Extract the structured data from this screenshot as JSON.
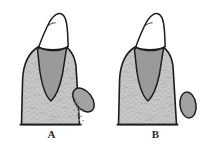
{
  "figure": {
    "type": "two-panel grayscale line illustration",
    "background_color": "#ffffff",
    "panels": [
      {
        "id": "A",
        "label": "A",
        "description": "Tooth in alveolar bone with tilted oval structure and dotted migration trail",
        "structures": {
          "crown": {
            "name": "tooth-crown",
            "fill_color": "#ffffff",
            "stroke_color": "#1c1c1c"
          },
          "root": {
            "name": "tooth-root",
            "fill_color": "#9a9a9a",
            "stroke_color": "#1c1c1c"
          },
          "bone": {
            "name": "alveolar-bone",
            "fill_color": "#c9c9c9",
            "stroke_color": "#1c1c1c",
            "texture": "stipple"
          },
          "oval": {
            "name": "adjacent-oval-body",
            "fill_color": "#a2a2a2",
            "stroke_color": "#1c1c1c",
            "orientation": "tilted",
            "rotation_deg": -38
          },
          "trail": {
            "name": "dotted-trail",
            "dot_color": "#8d8d8d",
            "dot_count": 13,
            "visible": true
          }
        }
      },
      {
        "id": "B",
        "label": "B",
        "description": "Tooth in alveolar bone with upright oval structure, no trail",
        "structures": {
          "crown": {
            "name": "tooth-crown",
            "fill_color": "#ffffff",
            "stroke_color": "#1c1c1c"
          },
          "root": {
            "name": "tooth-root",
            "fill_color": "#9a9a9a",
            "stroke_color": "#1c1c1c"
          },
          "bone": {
            "name": "alveolar-bone",
            "fill_color": "#c9c9c9",
            "stroke_color": "#1c1c1c",
            "texture": "stipple"
          },
          "oval": {
            "name": "adjacent-oval-body",
            "fill_color": "#a2a2a2",
            "stroke_color": "#1c1c1c",
            "orientation": "upright",
            "rotation_deg": -8
          },
          "trail": {
            "name": "dotted-trail",
            "dot_color": "#8d8d8d",
            "dot_count": 0,
            "visible": false
          }
        }
      }
    ]
  }
}
